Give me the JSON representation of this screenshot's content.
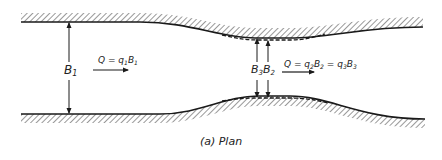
{
  "figure": {
    "caption": "(a) Plan",
    "colors": {
      "ink": "#1a1a1a",
      "hatch": "#444444",
      "background": "#ffffff"
    }
  },
  "labels": {
    "b1": {
      "main": "B",
      "sub": "1"
    },
    "b2": {
      "main": "B",
      "sub": "2"
    },
    "b3": {
      "main": "B",
      "sub": "3"
    },
    "flow_upstream": {
      "text": "Q = q",
      "sub1": "1",
      "rest": "B",
      "sub2": "1"
    },
    "flow_constriction": {
      "text": "Q = q",
      "sub1": "2",
      "mid": "B",
      "sub2": "2",
      "eq": " = q",
      "sub3": "3",
      "end": "B",
      "sub4": "3"
    }
  }
}
